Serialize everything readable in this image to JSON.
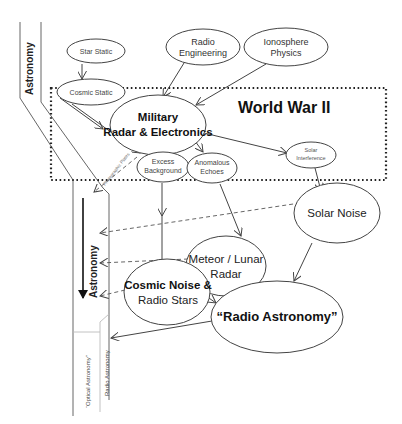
{
  "diagram": {
    "title": "World War II",
    "nodes": {
      "star_static": "Star Static",
      "radio_engineering_1": "Radio",
      "radio_engineering_2": "Engineering",
      "ionosphere_1": "Ionosphere",
      "ionosphere_2": "Physics",
      "cosmic_static": "Cosmic Static",
      "military_1": "Military",
      "military_2": "Radar & Electronics",
      "excess_1": "Excess",
      "excess_2": "Background",
      "anomalous_1": "Anomalous",
      "anomalous_2": "Echoes",
      "solar_interference_1": "Solar",
      "solar_interference_2": "Interference",
      "solar_noise": "Solar Noise",
      "meteor_1": "Meteor / Lunar",
      "meteor_2": "Radar",
      "cosmic_noise_1": "Cosmic Noise &",
      "cosmic_noise_2": "Radio Stars",
      "radio_astronomy": "“Radio  Astronomy”"
    },
    "streams": {
      "astronomy_top": "Astronomy",
      "astronomy_mid": "Astronomy",
      "optical_astronomy": "“Optical Astronomy”",
      "radio_astronomy": "Radio Astronomy",
      "dashed_label": "Photographic Plates"
    },
    "colors": {
      "line": "#444444",
      "text": "#222222",
      "background": "#ffffff"
    }
  }
}
